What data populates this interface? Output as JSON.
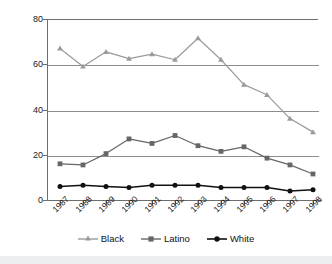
{
  "chart_data": {
    "type": "line",
    "title": "",
    "xlabel": "",
    "ylabel": "",
    "categories": [
      "1987",
      "1988",
      "1989",
      "1990",
      "1991",
      "1992",
      "1993",
      "1994",
      "1995",
      "1996",
      "1997",
      "1998"
    ],
    "ylim": [
      0,
      80
    ],
    "yticks": [
      0,
      20,
      40,
      60,
      80
    ],
    "ytick_labels": [
      "0",
      "20",
      "40",
      "60",
      "80"
    ],
    "grid": true,
    "grid_axis": "y",
    "legend_position": "bottom",
    "series": [
      {
        "name": "Black",
        "color": "#9a9a9a",
        "marker": "triangle",
        "values": [
          67,
          59,
          65.5,
          62.5,
          64.5,
          62,
          71.5,
          62,
          51,
          46.5,
          36,
          30
        ]
      },
      {
        "name": "Latino",
        "color": "#666666",
        "marker": "square",
        "values": [
          16,
          15.5,
          20.5,
          27,
          25,
          28.5,
          24,
          21.5,
          23.5,
          18.5,
          15.5,
          11.5
        ]
      },
      {
        "name": "White",
        "color": "#111111",
        "marker": "circle",
        "values": [
          6,
          6.5,
          6,
          5.5,
          6.5,
          6.5,
          6.5,
          5.5,
          5.5,
          5.5,
          4,
          4.5
        ]
      }
    ]
  },
  "legend": {
    "entries": [
      {
        "label": "Black"
      },
      {
        "label": "Latino"
      },
      {
        "label": "White"
      }
    ]
  },
  "colors": {
    "axis": "#6e6e6e",
    "grid": "#8d8d8d",
    "background": "#ffffff",
    "bottom_strip": "#eceef0",
    "black_series": "#9a9a9a",
    "latino_series": "#666666",
    "white_series": "#111111"
  }
}
